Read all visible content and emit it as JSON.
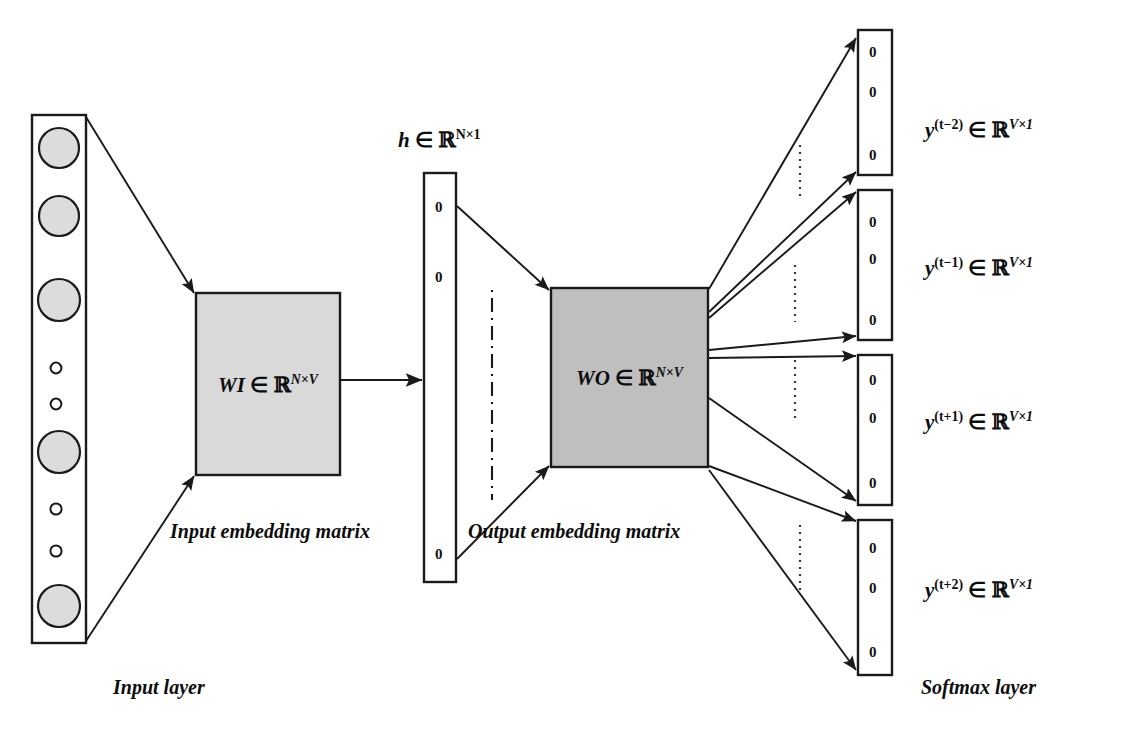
{
  "figure": {
    "background_color": "#ffffff",
    "stroke_color": "#1a1a1a"
  },
  "input_layer": {
    "name": "Input layer",
    "caption": "Input layer",
    "box": {
      "x": 32,
      "y": 115,
      "width": 54,
      "height": 528
    },
    "fill": "#ffffff",
    "node_fill": "#d9d9d9",
    "nodes": [
      {
        "type": "large",
        "cy": 148
      },
      {
        "type": "large",
        "cy": 216
      },
      {
        "type": "large",
        "cy": 300
      },
      {
        "type": "small",
        "cy": 368
      },
      {
        "type": "small",
        "cy": 404
      },
      {
        "type": "large",
        "cy": 452
      },
      {
        "type": "small",
        "cy": 509
      },
      {
        "type": "small",
        "cy": 551
      },
      {
        "type": "large",
        "cy": 606
      }
    ]
  },
  "input_matrix": {
    "label_var": "WI",
    "label_in": "∈",
    "label_set": "ℝ",
    "label_exp": "N×V",
    "caption": "Input embedding matrix",
    "box": {
      "x": 196,
      "y": 293,
      "width": 144,
      "height": 182
    },
    "fill": "#d9d9d9"
  },
  "hidden_layer": {
    "label_var": "h",
    "label_in": "∈",
    "label_set": "ℝ",
    "label_exp": "N×1",
    "box": {
      "x": 424,
      "y": 173,
      "width": 32,
      "height": 409
    },
    "fill": "#ffffff",
    "cells": [
      "0",
      "0",
      "0"
    ],
    "cell_y": [
      207,
      277,
      554
    ],
    "ellipsis": {
      "x": 492,
      "y1": 290,
      "y2": 500
    }
  },
  "output_matrix": {
    "label_var": "WO",
    "label_in": "∈",
    "label_set": "ℝ",
    "label_exp": "N×V",
    "caption": "Output embedding matrix",
    "box": {
      "x": 551,
      "y": 288,
      "width": 157,
      "height": 179
    },
    "fill": "#bfbfbf"
  },
  "softmax_layer": {
    "caption": "Softmax layer",
    "box_fill": "#ffffff",
    "vectors": [
      {
        "id": "y-t-minus-2",
        "var": "y",
        "superscript": "(t−2)",
        "in": "∈",
        "set": "ℝ",
        "exp": "V×1",
        "box": {
          "x": 858,
          "y": 30,
          "width": 34,
          "height": 145
        },
        "cells": [
          "0",
          "0",
          "0"
        ],
        "cell_y": [
          52,
          92,
          155
        ],
        "label_x": 925,
        "label_y": 128,
        "ellipsis": {
          "x": 800,
          "y1": 145,
          "y2": 195
        }
      },
      {
        "id": "y-t-minus-1",
        "var": "y",
        "superscript": "(t−1)",
        "in": "∈",
        "set": "ℝ",
        "exp": "V×1",
        "box": {
          "x": 858,
          "y": 190,
          "width": 34,
          "height": 150
        },
        "cells": [
          "0",
          "0",
          "0"
        ],
        "cell_y": [
          222,
          259,
          320
        ],
        "label_x": 925,
        "label_y": 266,
        "ellipsis": {
          "x": 795,
          "y1": 265,
          "y2": 320
        }
      },
      {
        "id": "y-t-plus-1",
        "var": "y",
        "superscript": "(t+1)",
        "in": "∈",
        "set": "ℝ",
        "exp": "V×1",
        "box": {
          "x": 858,
          "y": 355,
          "width": 34,
          "height": 150
        },
        "cells": [
          "0",
          "0",
          "0"
        ],
        "cell_y": [
          380,
          418,
          483
        ],
        "label_x": 925,
        "label_y": 420,
        "ellipsis": {
          "x": 795,
          "y1": 360,
          "y2": 420
        }
      },
      {
        "id": "y-t-plus-2",
        "var": "y",
        "superscript": "(t+2)",
        "in": "∈",
        "set": "ℝ",
        "exp": "V×1",
        "box": {
          "x": 858,
          "y": 520,
          "width": 34,
          "height": 155
        },
        "cells": [
          "0",
          "0",
          "0"
        ],
        "cell_y": [
          548,
          588,
          652
        ],
        "label_x": 925,
        "label_y": 588,
        "ellipsis": {
          "x": 800,
          "y1": 525,
          "y2": 590
        }
      }
    ]
  },
  "connections": {
    "input_to_wi_top": "line from input layer top-right to WI box top-left",
    "input_to_wi_bottom": "line from input layer bottom-right to WI box bottom-left",
    "wi_to_hidden": "horizontal arrow from WI right edge to hidden layer",
    "hidden_to_wo_top": "line from hidden layer top cell to WO top-left",
    "hidden_to_wo_bottom": "line from hidden layer bottom cell to WO bottom-left",
    "wo_to_outputs": "eight arrows fanning from WO right edge to the four softmax vectors"
  }
}
